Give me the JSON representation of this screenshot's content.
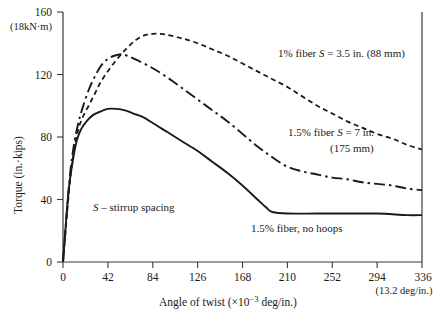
{
  "chart_data": {
    "type": "line",
    "title": "",
    "xlabel": "Angle of twist (×10⁻³ deg/in.)",
    "ylabel": "Torque (in.·kips)",
    "xlim": [
      0,
      336
    ],
    "ylim": [
      0,
      160
    ],
    "grid": false,
    "legend_position": "inline-annotations",
    "xticks": [
      0,
      42,
      84,
      126,
      168,
      210,
      252,
      294,
      336
    ],
    "xtick_labels": [
      "0",
      "42",
      "84",
      "126",
      "168",
      "210",
      "252",
      "294",
      "336"
    ],
    "xtick_sublabel": "(13.2 deg/in.)",
    "yticks": [
      0,
      40,
      80,
      120,
      160
    ],
    "ytick_labels": [
      "0",
      "40",
      "80",
      "120",
      "160"
    ],
    "ytick_sublabel": "(18kN·m)",
    "series": [
      {
        "name": "1% fiber S = 3.5 in. (88 mm)",
        "style": "dashed",
        "x": [
          0,
          6,
          10,
          14,
          18,
          24,
          30,
          36,
          44,
          52,
          60,
          68,
          76,
          84,
          92,
          100,
          112,
          126,
          140,
          154,
          168,
          182,
          196,
          210,
          224,
          238,
          252,
          266,
          280,
          294,
          308,
          322,
          336
        ],
        "y": [
          0,
          48,
          70,
          84,
          92,
          100,
          108,
          116,
          124,
          131,
          137,
          142,
          145,
          146,
          146,
          145,
          143,
          140,
          136,
          132,
          127,
          122,
          117,
          112,
          106,
          100,
          95,
          90,
          86,
          82,
          79,
          75,
          72
        ]
      },
      {
        "name": "1.5% fiber S = 7 in. (175 mm)",
        "style": "dash-dot",
        "x": [
          0,
          6,
          10,
          14,
          18,
          24,
          30,
          36,
          42,
          48,
          54,
          60,
          70,
          84,
          98,
          112,
          126,
          140,
          154,
          168,
          182,
          196,
          210,
          224,
          238,
          252,
          266,
          280,
          294,
          308,
          322,
          336
        ],
        "y": [
          0,
          52,
          74,
          88,
          98,
          110,
          119,
          126,
          130,
          132,
          133,
          132,
          129,
          124,
          118,
          111,
          104,
          97,
          90,
          82,
          74,
          67,
          61,
          58,
          56,
          54,
          53,
          51,
          50,
          49,
          47,
          46
        ]
      },
      {
        "name": "1.5% fiber, no hoops",
        "style": "solid",
        "x": [
          0,
          5,
          9,
          13,
          17,
          22,
          28,
          34,
          42,
          50,
          58,
          66,
          74,
          84,
          98,
          112,
          126,
          140,
          154,
          168,
          182,
          190,
          196,
          210,
          238,
          266,
          294,
          322,
          336
        ],
        "y": [
          0,
          44,
          64,
          78,
          85,
          90,
          94,
          96,
          98,
          98,
          97,
          95,
          93,
          89,
          83,
          77,
          71,
          64,
          57,
          49,
          40,
          35,
          32,
          31,
          31,
          31,
          31,
          30,
          30
        ]
      }
    ],
    "annotations": [
      {
        "name": "annotation-1pct-fiber",
        "lines": [
          "1% fiber S = 3.5 in. (88 mm)"
        ],
        "italic_token": "S"
      },
      {
        "name": "annotation-15pct-fiber-s7",
        "lines": [
          "1.5% fiber S = 7 in.",
          "(175 mm)"
        ],
        "italic_token": "S"
      },
      {
        "name": "annotation-15pct-no-hoops",
        "lines": [
          "1.5% fiber, no hoops"
        ],
        "italic_token": ""
      },
      {
        "name": "annotation-stirrup-key",
        "lines": [
          "S – stirrup spacing"
        ],
        "italic_token": "S"
      }
    ]
  },
  "labels": {
    "y_title": "Torque (in.·kips)",
    "y_top_tick": "160",
    "y_top_sub": "(18kN·m)",
    "y_tick_120": "120",
    "y_tick_80": "80",
    "y_tick_40": "40",
    "y_tick_0": "0",
    "x_title": "Angle of twist (×10",
    "x_title_exp": "−3",
    "x_title_tail": " deg/in.)",
    "x_tick_0": "0",
    "x_tick_42": "42",
    "x_tick_84": "84",
    "x_tick_126": "126",
    "x_tick_168": "168",
    "x_tick_210": "210",
    "x_tick_252": "252",
    "x_tick_294": "294",
    "x_tick_336": "336",
    "x_tick_sub": "(13.2 deg/in.)",
    "annot_1pct_a": "1% fiber ",
    "annot_1pct_s": "S",
    "annot_1pct_b": " = 3.5 in. (88 mm)",
    "annot_15pct_a": "1.5% fiber ",
    "annot_15pct_s": "S",
    "annot_15pct_b": " = 7 in.",
    "annot_15pct_line2": "(175 mm)",
    "annot_nohoops": "1.5% fiber, no hoops",
    "annot_key_s": "S",
    "annot_key_rest": " – stirrup spacing"
  },
  "colors": {
    "ink": "#1a1a1a",
    "axis": "#3a3a3a",
    "background": "#ffffff"
  }
}
